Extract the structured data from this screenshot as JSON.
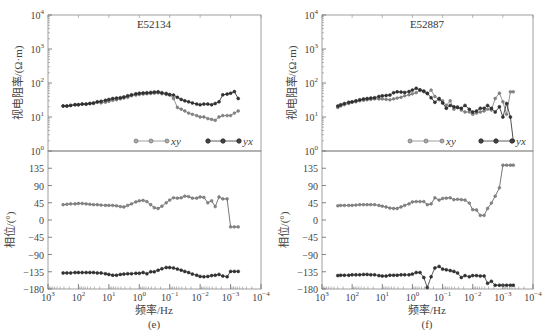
{
  "chart_data": [
    {
      "type": "line",
      "panel": "e",
      "caption": "(e)",
      "title": "E52134",
      "xlabel": "频率/Hz",
      "x_scale": "log",
      "x_ticks": [
        "10^3",
        "10^2",
        "10^1",
        "10^0",
        "10^-1",
        "10^-2",
        "10^-3",
        "10^-4"
      ],
      "xlim": [
        1000,
        0.0001
      ],
      "top": {
        "ylabel": "视电阻率/(Ω·m)",
        "y_scale": "log",
        "ylim": [
          1,
          10000
        ],
        "y_ticks": [
          "10^0",
          "10^1",
          "10^2",
          "10^3",
          "10^4"
        ],
        "legend": [
          {
            "name": "xy",
            "style": "gray-open-diamond"
          },
          {
            "name": "yx",
            "style": "dark-filled-diamond"
          }
        ],
        "series": [
          {
            "name": "xy",
            "color": "#777777",
            "x": [
              320,
              240,
              180,
              130,
              100,
              75,
              56,
              42,
              32,
              24,
              18,
              13,
              10,
              7.5,
              5.6,
              4.2,
              3.2,
              2.4,
              1.8,
              1.3,
              1.0,
              0.75,
              0.56,
              0.42,
              0.32,
              0.24,
              0.18,
              0.13,
              0.1,
              0.075,
              0.056,
              0.042,
              0.032,
              0.024,
              0.018,
              0.013,
              0.01,
              0.0075,
              0.0056,
              0.0042,
              0.0032,
              0.0024,
              0.0018,
              0.0013,
              0.001,
              0.00075,
              0.00056
            ],
            "y": [
              21,
              21,
              22,
              23,
              23,
              24,
              24,
              25,
              25,
              27,
              26,
              27,
              29,
              31,
              32,
              34,
              36,
              38,
              42,
              44,
              46,
              47,
              48,
              49,
              50,
              51,
              48,
              46,
              44,
              35,
              19,
              17,
              15,
              13,
              12,
              11,
              10,
              10,
              9,
              8.5,
              8,
              10,
              11,
              11,
              11,
              13,
              15
            ]
          },
          {
            "name": "yx",
            "color": "#222222",
            "x": [
              320,
              240,
              180,
              130,
              100,
              75,
              56,
              42,
              32,
              24,
              18,
              13,
              10,
              7.5,
              5.6,
              4.2,
              3.2,
              2.4,
              1.8,
              1.3,
              1.0,
              0.75,
              0.56,
              0.42,
              0.32,
              0.24,
              0.18,
              0.13,
              0.1,
              0.075,
              0.056,
              0.042,
              0.032,
              0.024,
              0.018,
              0.013,
              0.01,
              0.0075,
              0.0056,
              0.0042,
              0.0032,
              0.0024,
              0.0018,
              0.0013,
              0.001,
              0.00075,
              0.00056
            ],
            "y": [
              21,
              21,
              22,
              23,
              23,
              24,
              24,
              25,
              26,
              28,
              29,
              31,
              33,
              35,
              36,
              37,
              39,
              42,
              45,
              48,
              50,
              51,
              52,
              53,
              54,
              55,
              52,
              49,
              46,
              44,
              38,
              33,
              30,
              28,
              26,
              24,
              23,
              24,
              24,
              23,
              25,
              28,
              45,
              47,
              50,
              56,
              35
            ]
          }
        ]
      },
      "bottom": {
        "ylabel": "相位/(°)",
        "y_scale": "linear",
        "ylim": [
          -180,
          180
        ],
        "y_ticks": [
          135,
          90,
          45,
          0,
          -45,
          -90,
          -135,
          -180
        ],
        "series": [
          {
            "name": "xy",
            "color": "#555555",
            "x": [
              320,
              240,
              180,
              130,
              100,
              75,
              56,
              42,
              32,
              24,
              18,
              13,
              10,
              7.5,
              5.6,
              4.2,
              3.2,
              2.4,
              1.8,
              1.3,
              1.0,
              0.75,
              0.56,
              0.42,
              0.32,
              0.24,
              0.18,
              0.13,
              0.1,
              0.075,
              0.056,
              0.042,
              0.032,
              0.024,
              0.018,
              0.013,
              0.01,
              0.0075,
              0.0056,
              0.0042,
              0.0032,
              0.0024,
              0.0018,
              0.0013,
              0.001,
              0.00075,
              0.00056
            ],
            "y": [
              40,
              41,
              42,
              42,
              43,
              43,
              42,
              41,
              40,
              40,
              39,
              38,
              38,
              38,
              37,
              35,
              34,
              38,
              42,
              47,
              50,
              51,
              48,
              40,
              32,
              30,
              36,
              45,
              52,
              58,
              57,
              58,
              62,
              61,
              57,
              57,
              60,
              59,
              45,
              50,
              35,
              60,
              55,
              55,
              -18,
              -18,
              -18
            ]
          },
          {
            "name": "yx",
            "color": "#333333",
            "x": [
              320,
              240,
              180,
              130,
              100,
              75,
              56,
              42,
              32,
              24,
              18,
              13,
              10,
              7.5,
              5.6,
              4.2,
              3.2,
              2.4,
              1.8,
              1.3,
              1.0,
              0.75,
              0.56,
              0.42,
              0.32,
              0.24,
              0.18,
              0.13,
              0.1,
              0.075,
              0.056,
              0.042,
              0.032,
              0.024,
              0.018,
              0.013,
              0.01,
              0.0075,
              0.0056,
              0.0042,
              0.0032,
              0.0024,
              0.0018,
              0.0013,
              0.001,
              0.00075,
              0.00056
            ],
            "y": [
              -138,
              -138,
              -138,
              -137,
              -137,
              -137,
              -137,
              -137,
              -137,
              -138,
              -138,
              -140,
              -142,
              -144,
              -144,
              -142,
              -141,
              -140,
              -140,
              -139,
              -139,
              -137,
              -140,
              -135,
              -135,
              -131,
              -127,
              -124,
              -124,
              -125,
              -128,
              -131,
              -134,
              -137,
              -141,
              -144,
              -147,
              -148,
              -147,
              -145,
              -144,
              -142,
              -146,
              -148,
              -134,
              -134,
              -134
            ]
          }
        ]
      }
    },
    {
      "type": "line",
      "panel": "f",
      "caption": "(f)",
      "title": "E52887",
      "xlabel": "频率/Hz",
      "x_scale": "log",
      "x_ticks": [
        "10^3",
        "10^2",
        "10^1",
        "10^0",
        "10^-1",
        "10^-2",
        "10^-3",
        "10^-4"
      ],
      "xlim": [
        1000,
        0.0001
      ],
      "top": {
        "ylabel": "视电阻率/(Ω·m)",
        "y_scale": "log",
        "ylim": [
          1,
          10000
        ],
        "y_ticks": [
          "10^0",
          "10^1",
          "10^2",
          "10^3",
          "10^4"
        ],
        "legend": [
          {
            "name": "xy",
            "style": "gray-open-diamond"
          },
          {
            "name": "yx",
            "style": "dark-filled-diamond"
          }
        ],
        "series": [
          {
            "name": "xy",
            "color": "#777777",
            "x": [
              300,
              240,
              180,
              130,
              100,
              75,
              56,
              42,
              32,
              24,
              18,
              13,
              10,
              7.5,
              5.6,
              4.2,
              3.2,
              2.4,
              1.8,
              1.3,
              1.0,
              0.75,
              0.56,
              0.42,
              0.32,
              0.24,
              0.18,
              0.13,
              0.1,
              0.075,
              0.056,
              0.042,
              0.032,
              0.024,
              0.018,
              0.013,
              0.01,
              0.0075,
              0.0056,
              0.0042,
              0.0032,
              0.0024,
              0.0018,
              0.0013,
              0.001,
              0.00075,
              0.00056,
              0.00045
            ],
            "y": [
              19,
              21,
              23,
              25,
              27,
              28,
              30,
              31,
              32,
              33,
              34,
              34,
              34,
              33,
              32,
              34,
              36,
              38,
              42,
              45,
              48,
              52,
              60,
              55,
              48,
              62,
              40,
              32,
              30,
              22,
              30,
              17,
              20,
              16,
              14,
              14,
              12,
              13,
              14,
              15,
              17,
              16,
              35,
              50,
              28,
              12,
              55,
              55
            ]
          },
          {
            "name": "yx",
            "color": "#222222",
            "x": [
              300,
              240,
              180,
              130,
              100,
              75,
              56,
              42,
              32,
              24,
              18,
              13,
              10,
              7.5,
              5.6,
              4.2,
              3.2,
              2.4,
              1.8,
              1.3,
              1.0,
              0.75,
              0.56,
              0.42,
              0.32,
              0.24,
              0.18,
              0.13,
              0.1,
              0.075,
              0.056,
              0.042,
              0.032,
              0.024,
              0.018,
              0.013,
              0.01,
              0.0075,
              0.0056,
              0.0042,
              0.0032,
              0.0024,
              0.0018,
              0.0013,
              0.001,
              0.00075,
              0.00056,
              0.00045
            ],
            "y": [
              21,
              23,
              25,
              27,
              28,
              30,
              32,
              34,
              35,
              36,
              37,
              40,
              42,
              43,
              44,
              52,
              55,
              54,
              53,
              56,
              62,
              70,
              63,
              58,
              50,
              37,
              27,
              35,
              26,
              18,
              22,
              20,
              19,
              18,
              22,
              17,
              14,
              15,
              18,
              18,
              22,
              18,
              14,
              20,
              10,
              25,
              10,
              2
            ]
          }
        ]
      },
      "bottom": {
        "ylabel": "相位/(°)",
        "y_scale": "linear",
        "ylim": [
          -180,
          180
        ],
        "y_ticks": [
          135,
          90,
          45,
          0,
          -45,
          -90,
          -135,
          -180
        ],
        "series": [
          {
            "name": "xy",
            "color": "#555555",
            "x": [
              300,
              240,
              180,
              130,
              100,
              75,
              56,
              42,
              32,
              24,
              18,
              13,
              10,
              7.5,
              5.6,
              4.2,
              3.2,
              2.4,
              1.8,
              1.3,
              1.0,
              0.75,
              0.56,
              0.42,
              0.32,
              0.24,
              0.18,
              0.13,
              0.1,
              0.075,
              0.056,
              0.042,
              0.032,
              0.024,
              0.018,
              0.013,
              0.01,
              0.0075,
              0.0056,
              0.0042,
              0.0032,
              0.0024,
              0.0018,
              0.0013,
              0.001,
              0.00075,
              0.00056,
              0.00045
            ],
            "y": [
              37,
              38,
              38,
              38,
              38,
              39,
              40,
              40,
              40,
              40,
              40,
              38,
              36,
              34,
              31,
              30,
              30,
              34,
              38,
              42,
              47,
              48,
              48,
              48,
              40,
              42,
              58,
              52,
              56,
              57,
              58,
              53,
              54,
              53,
              52,
              44,
              27,
              26,
              12,
              12,
              30,
              44,
              62,
              84,
              143,
              143,
              143,
              143
            ]
          },
          {
            "name": "yx",
            "color": "#333333",
            "x": [
              300,
              240,
              180,
              130,
              100,
              75,
              56,
              42,
              32,
              24,
              18,
              13,
              10,
              7.5,
              5.6,
              4.2,
              3.2,
              2.4,
              1.8,
              1.3,
              1.0,
              0.75,
              0.56,
              0.42,
              0.32,
              0.24,
              0.18,
              0.13,
              0.1,
              0.075,
              0.056,
              0.042,
              0.032,
              0.024,
              0.018,
              0.013,
              0.01,
              0.0075,
              0.0056,
              0.0042,
              0.0032,
              0.0024,
              0.0018,
              0.0013,
              0.001,
              0.00075,
              0.00056,
              0.00045
            ],
            "y": [
              -145,
              -144,
              -144,
              -144,
              -143,
              -143,
              -143,
              -142,
              -142,
              -143,
              -143,
              -145,
              -146,
              -146,
              -144,
              -144,
              -144,
              -143,
              -143,
              -143,
              -141,
              -137,
              -137,
              -150,
              -176,
              -148,
              -125,
              -121,
              -128,
              -130,
              -132,
              -134,
              -138,
              -150,
              -145,
              -148,
              -145,
              -145,
              -146,
              -146,
              -165,
              -160,
              -170,
              -170,
              -170,
              -170,
              -170,
              -170
            ]
          }
        ]
      }
    }
  ],
  "panels": [
    {
      "title": "E52134",
      "caption": "(e)",
      "xlabel": "频率/Hz",
      "ylabel_top": "视电阻率/(Ω·m)",
      "ylabel_bottom": "相位/(°)"
    },
    {
      "title": "E52887",
      "caption": "(f)",
      "xlabel": "频率/Hz",
      "ylabel_top": "视电阻率/(Ω·m)",
      "ylabel_bottom": "相位/(°)"
    }
  ],
  "legend": {
    "xy": "xy",
    "yx": "yx"
  }
}
